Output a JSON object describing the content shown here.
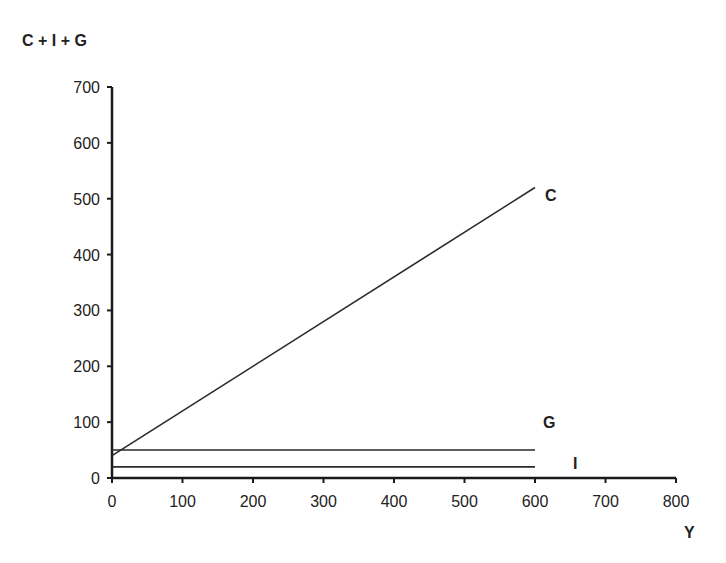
{
  "chart_data": {
    "type": "line",
    "title": "",
    "xlabel": "Y",
    "ylabel": "C + I + G",
    "xlim": [
      0,
      800
    ],
    "ylim": [
      0,
      700
    ],
    "x_ticks": [
      0,
      100,
      200,
      300,
      400,
      500,
      600,
      700,
      800
    ],
    "y_ticks": [
      0,
      100,
      200,
      300,
      400,
      500,
      600,
      700
    ],
    "grid": false,
    "legend": "inline labels at line ends",
    "series": [
      {
        "name": "C",
        "x": [
          0,
          600
        ],
        "values": [
          40,
          520
        ]
      },
      {
        "name": "G",
        "x": [
          0,
          600
        ],
        "values": [
          50,
          50
        ]
      },
      {
        "name": "I",
        "x": [
          0,
          600
        ],
        "values": [
          20,
          20
        ]
      }
    ]
  }
}
